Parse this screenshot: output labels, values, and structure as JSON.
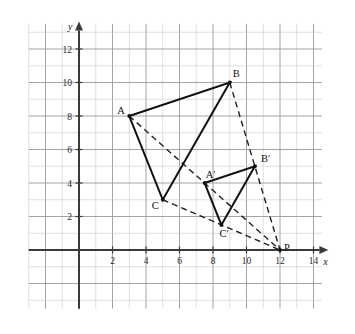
{
  "figure": {
    "axis_x_label": "x",
    "axis_y_label": "y"
  },
  "chart_data": {
    "type": "scatter",
    "title": "",
    "xlabel": "x",
    "ylabel": "y",
    "xlim": [
      -3,
      14.5
    ],
    "ylim": [
      -3.5,
      13.5
    ],
    "grid": true,
    "legend": "none",
    "x_ticks": [
      2,
      4,
      6,
      8,
      10,
      12,
      14
    ],
    "x_tick_labels": [
      "2",
      "4",
      "6",
      "8",
      "10",
      "12",
      "14"
    ],
    "y_ticks": [
      2,
      4,
      6,
      8,
      10,
      12
    ],
    "y_tick_labels": [
      "2",
      "4",
      "6",
      "8",
      "10",
      "12"
    ],
    "points": [
      {
        "label": "A",
        "x": 3,
        "y": 8
      },
      {
        "label": "B",
        "x": 9,
        "y": 10
      },
      {
        "label": "C",
        "x": 5,
        "y": 3
      },
      {
        "label": "A'",
        "x": 7.5,
        "y": 4
      },
      {
        "label": "B'",
        "x": 10.5,
        "y": 5
      },
      {
        "label": "C'",
        "x": 8.5,
        "y": 1.5
      },
      {
        "label": "P",
        "x": 12,
        "y": 0
      }
    ],
    "series": [
      {
        "name": "triangle ABC",
        "style": "solid",
        "vertices": [
          [
            3,
            8
          ],
          [
            9,
            10
          ],
          [
            5,
            3
          ]
        ]
      },
      {
        "name": "triangle A'B'C'",
        "style": "solid",
        "vertices": [
          [
            7.5,
            4
          ],
          [
            10.5,
            5
          ],
          [
            8.5,
            1.5
          ]
        ]
      }
    ],
    "rays": [
      {
        "name": "ray-A-to-P",
        "style": "dashed",
        "from": [
          3,
          8
        ],
        "to": [
          12,
          0
        ]
      },
      {
        "name": "ray-B-to-P",
        "style": "dashed",
        "from": [
          9,
          10
        ],
        "to": [
          12,
          0
        ]
      },
      {
        "name": "ray-C-to-P",
        "style": "dashed",
        "from": [
          5,
          3
        ],
        "to": [
          12,
          0
        ]
      }
    ]
  },
  "labels": {
    "A": "A",
    "B": "B",
    "C": "C",
    "Aprime": "A′",
    "Bprime": "B′",
    "Cprime": "C′",
    "P": "P",
    "x_axis": "x",
    "y_axis": "y",
    "tick_2": "2",
    "tick_4": "4",
    "tick_6": "6",
    "tick_8": "8",
    "tick_10": "10",
    "tick_12": "12",
    "tick_14": "14",
    "ytick_2": "2",
    "ytick_4": "4",
    "ytick_6": "6",
    "ytick_8": "8",
    "ytick_10": "10",
    "ytick_12": "12"
  },
  "colors": {
    "grid_minor": "#c9c9c9",
    "grid_major": "#9a9a9a",
    "axis": "#3a3a3a",
    "shape_solid": "#111111",
    "shape_dashed": "#222222",
    "background": "#ffffff"
  }
}
